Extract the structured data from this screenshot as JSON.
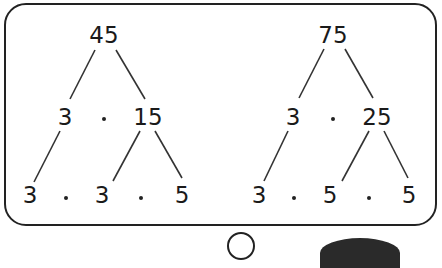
{
  "trees": [
    {
      "root": "45",
      "level1": {
        "left": "3",
        "right": "15"
      },
      "level2": [
        "3",
        "3",
        "5"
      ]
    },
    {
      "root": "75",
      "level1": {
        "left": "3",
        "right": "25"
      },
      "level2": [
        "3",
        "5",
        "5"
      ]
    }
  ],
  "operator": "·"
}
